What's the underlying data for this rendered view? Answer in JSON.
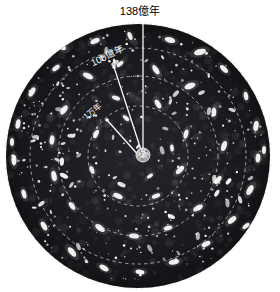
{
  "figure": {
    "title_label": "138億年",
    "background_color": "#ffffff",
    "disk_color": "#1b1b1f",
    "disk_edge_color": "#e8e8e8",
    "line_color": "#ffffff",
    "dashed_circle_color": "#cfcfcf",
    "center": {
      "cx": 138,
      "cy": 156,
      "r": 133
    },
    "center_blob": {
      "cx": 143,
      "cy": 155,
      "r": 7,
      "name": "big-bang-core"
    },
    "annotations": [
      {
        "id": "age-universe",
        "label": "138億年",
        "label_x": 140,
        "label_y": 12,
        "rotation": 0,
        "anchor": "middle",
        "line_x1": 143,
        "line_y1": 154,
        "line_x2": 143,
        "line_y2": 21,
        "dot_x": 143,
        "dot_y": 21,
        "text_color": "#000000"
      },
      {
        "id": "ten-billion-years",
        "label": "100億年",
        "label_x": 92,
        "label_y": 64,
        "rotation": -26,
        "anchor": "start",
        "line_x1": 142,
        "line_y1": 153,
        "line_x2": 114,
        "line_y2": 67,
        "dot_x": 114,
        "dot_y": 67,
        "text_color": "#ffffff"
      },
      {
        "id": "ten-thousand-years",
        "label": "1万年",
        "label_x": 85,
        "label_y": 118,
        "rotation": -40,
        "anchor": "start",
        "line_x1": 140,
        "line_y1": 157,
        "line_x2": 107,
        "line_y2": 120,
        "dot_x": 107,
        "dot_y": 120,
        "text_color": "#ffffff"
      }
    ],
    "dashed_circles": [
      {
        "id": "ring-outer",
        "r": 108
      },
      {
        "id": "ring-middle",
        "r": 80
      },
      {
        "id": "ring-inner",
        "r": 50
      }
    ]
  },
  "chart_data": {
    "type": "scatter",
    "title": "138億年",
    "xlabel": "",
    "ylabel": "",
    "legend_position": "none",
    "grid": false,
    "annotations": [
      {
        "label": "138億年",
        "radius_fraction": 1.0,
        "meaning": "edge-of-observable-universe"
      },
      {
        "label": "100億年",
        "radius_fraction": 0.68,
        "meaning": "ten-billion-years-lookback"
      },
      {
        "label": "1万年",
        "radius_fraction": 0.38,
        "meaning": "ten-thousand-years-lookback"
      }
    ],
    "rings": [
      {
        "label": "ring-outer",
        "radius": 108
      },
      {
        "label": "ring-middle",
        "radius": 80
      },
      {
        "label": "ring-inner",
        "radius": 50
      }
    ],
    "galaxies": [
      {
        "x": 61,
        "y": 46,
        "rx": 6.0,
        "ry": 3.0,
        "angle": 35
      },
      {
        "x": 95,
        "y": 41,
        "rx": 5.0,
        "ry": 2.6,
        "angle": -25
      },
      {
        "x": 130,
        "y": 36,
        "rx": 4.2,
        "ry": 2.2,
        "angle": 70
      },
      {
        "x": 170,
        "y": 40,
        "rx": 5.4,
        "ry": 2.8,
        "angle": 15
      },
      {
        "x": 200,
        "y": 52,
        "rx": 6.2,
        "ry": 3.0,
        "angle": -15
      },
      {
        "x": 224,
        "y": 69,
        "rx": 5.0,
        "ry": 2.4,
        "angle": 45
      },
      {
        "x": 246,
        "y": 96,
        "rx": 4.4,
        "ry": 2.2,
        "angle": 80
      },
      {
        "x": 256,
        "y": 126,
        "rx": 5.2,
        "ry": 2.6,
        "angle": 100
      },
      {
        "x": 258,
        "y": 158,
        "rx": 4.6,
        "ry": 2.4,
        "angle": 95
      },
      {
        "x": 250,
        "y": 190,
        "rx": 5.6,
        "ry": 2.8,
        "angle": 120
      },
      {
        "x": 232,
        "y": 220,
        "rx": 5.0,
        "ry": 2.6,
        "angle": 140
      },
      {
        "x": 206,
        "y": 244,
        "rx": 4.8,
        "ry": 2.4,
        "angle": 155
      },
      {
        "x": 174,
        "y": 262,
        "rx": 5.4,
        "ry": 2.6,
        "angle": 170
      },
      {
        "x": 140,
        "y": 272,
        "rx": 4.6,
        "ry": 2.3,
        "angle": 10
      },
      {
        "x": 104,
        "y": 268,
        "rx": 5.0,
        "ry": 2.5,
        "angle": 30
      },
      {
        "x": 72,
        "y": 252,
        "rx": 5.8,
        "ry": 2.8,
        "angle": 50
      },
      {
        "x": 44,
        "y": 226,
        "rx": 5.0,
        "ry": 2.5,
        "angle": 60
      },
      {
        "x": 24,
        "y": 194,
        "rx": 4.6,
        "ry": 2.3,
        "angle": 75
      },
      {
        "x": 14,
        "y": 160,
        "rx": 5.4,
        "ry": 2.6,
        "angle": 88
      },
      {
        "x": 18,
        "y": 124,
        "rx": 4.8,
        "ry": 2.4,
        "angle": 100
      },
      {
        "x": 32,
        "y": 92,
        "rx": 5.2,
        "ry": 2.6,
        "angle": 120
      },
      {
        "x": 56,
        "y": 68,
        "rx": 4.4,
        "ry": 2.2,
        "angle": 140
      },
      {
        "x": 88,
        "y": 76,
        "rx": 5.6,
        "ry": 2.8,
        "angle": 25
      },
      {
        "x": 120,
        "y": 64,
        "rx": 4.0,
        "ry": 2.0,
        "angle": -40
      },
      {
        "x": 156,
        "y": 70,
        "rx": 5.0,
        "ry": 2.5,
        "angle": 55
      },
      {
        "x": 190,
        "y": 86,
        "rx": 5.8,
        "ry": 2.9,
        "angle": -20
      },
      {
        "x": 214,
        "y": 112,
        "rx": 4.6,
        "ry": 2.3,
        "angle": 90
      },
      {
        "x": 224,
        "y": 146,
        "rx": 5.2,
        "ry": 2.6,
        "angle": 110
      },
      {
        "x": 218,
        "y": 180,
        "rx": 4.8,
        "ry": 2.4,
        "angle": 130
      },
      {
        "x": 198,
        "y": 208,
        "rx": 5.4,
        "ry": 2.7,
        "angle": 150
      },
      {
        "x": 168,
        "y": 228,
        "rx": 4.4,
        "ry": 2.2,
        "angle": 165
      },
      {
        "x": 134,
        "y": 236,
        "rx": 5.0,
        "ry": 2.5,
        "angle": 5
      },
      {
        "x": 100,
        "y": 228,
        "rx": 5.6,
        "ry": 2.8,
        "angle": 35
      },
      {
        "x": 72,
        "y": 206,
        "rx": 4.6,
        "ry": 2.3,
        "angle": 55
      },
      {
        "x": 54,
        "y": 176,
        "rx": 5.2,
        "ry": 2.6,
        "angle": 78
      },
      {
        "x": 52,
        "y": 140,
        "rx": 4.8,
        "ry": 2.4,
        "angle": 95
      },
      {
        "x": 64,
        "y": 110,
        "rx": 5.4,
        "ry": 2.7,
        "angle": 125
      },
      {
        "x": 116,
        "y": 98,
        "rx": 4.2,
        "ry": 2.1,
        "angle": 20
      },
      {
        "x": 158,
        "y": 104,
        "rx": 5.0,
        "ry": 2.5,
        "angle": 60
      },
      {
        "x": 186,
        "y": 134,
        "rx": 4.6,
        "ry": 2.3,
        "angle": 105
      },
      {
        "x": 180,
        "y": 170,
        "rx": 5.2,
        "ry": 2.6,
        "angle": 135
      },
      {
        "x": 156,
        "y": 196,
        "rx": 4.4,
        "ry": 2.2,
        "angle": 160
      },
      {
        "x": 118,
        "y": 196,
        "rx": 5.0,
        "ry": 2.5,
        "angle": 25
      },
      {
        "x": 92,
        "y": 170,
        "rx": 4.2,
        "ry": 2.1,
        "angle": 70
      },
      {
        "x": 96,
        "y": 134,
        "rx": 4.6,
        "ry": 2.3,
        "angle": 115
      },
      {
        "x": 126,
        "y": 118,
        "rx": 3.8,
        "ry": 1.9,
        "angle": 40
      },
      {
        "x": 172,
        "y": 148,
        "rx": 3.6,
        "ry": 1.8,
        "angle": 85
      },
      {
        "x": 150,
        "y": 176,
        "rx": 3.4,
        "ry": 1.7,
        "angle": 145
      },
      {
        "x": 40,
        "y": 60,
        "rx": 4.2,
        "ry": 2.1,
        "angle": 130
      },
      {
        "x": 236,
        "y": 60,
        "rx": 4.4,
        "ry": 2.2,
        "angle": 40
      },
      {
        "x": 246,
        "y": 226,
        "rx": 4.2,
        "ry": 2.1,
        "angle": 140
      },
      {
        "x": 40,
        "y": 252,
        "rx": 4.4,
        "ry": 2.2,
        "angle": 45
      },
      {
        "x": 264,
        "y": 150,
        "rx": 4.0,
        "ry": 2.0,
        "angle": 92
      },
      {
        "x": 12,
        "y": 142,
        "rx": 4.0,
        "ry": 2.0,
        "angle": 90
      }
    ]
  }
}
